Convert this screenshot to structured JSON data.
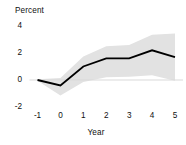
{
  "chart_data": {
    "type": "line",
    "title": "",
    "xlabel": "Year",
    "ylabel": "Percent",
    "xlim": [
      -1.35,
      5.35
    ],
    "ylim": [
      -2.6,
      4.5
    ],
    "grid": false,
    "legend_position": "none",
    "x": [
      -1,
      0,
      1,
      2,
      3,
      4,
      5
    ],
    "xtick_labels": [
      "-1",
      "0",
      "1",
      "2",
      "3",
      "4",
      "5"
    ],
    "ytick_labels": [
      "4",
      "2",
      "0",
      "-2"
    ],
    "ytick_values": [
      4,
      2,
      0,
      -2
    ],
    "zero_line": 0,
    "series": [
      {
        "name": "Estimate",
        "type": "line",
        "color": "#000000",
        "values": [
          0.0,
          -0.4,
          1.0,
          1.6,
          1.6,
          2.2,
          1.7
        ]
      },
      {
        "name": "Confidence band",
        "type": "area",
        "color": "#e2e2e2",
        "upper": [
          0.05,
          0.15,
          1.75,
          2.5,
          2.6,
          3.35,
          3.45
        ],
        "lower": [
          -0.05,
          -1.15,
          -0.15,
          0.2,
          0.25,
          0.35,
          -0.05
        ]
      }
    ],
    "annotations": []
  },
  "colors": {
    "line": "#000000",
    "band": "#e2e2e2",
    "zero_line": "#d9d9d9",
    "text": "#101010",
    "background": "#ffffff"
  }
}
